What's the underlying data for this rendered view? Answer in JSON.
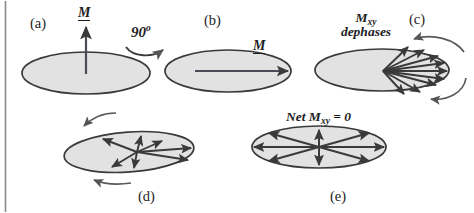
{
  "figure": {
    "title_semantic": "nmr-magnetization-dephasing-diagram",
    "background_color": "#ffffff",
    "border_color": "#8a8a8a",
    "ellipse_fill": "#e2e2e2",
    "ellipse_stroke": "#3a3a3a",
    "arrow_color": "#3a3a3a",
    "text_color": "#1d1d1d",
    "width": 474,
    "height": 213
  },
  "panels": {
    "a": {
      "letter": "(a)",
      "vector_label": "M",
      "description": "Longitudinal magnetization M along z, perpendicular to transverse plane"
    },
    "b": {
      "letter": "(b)",
      "vector_label": "M",
      "description": "Magnetization M tipped into transverse plane"
    },
    "c": {
      "letter": "(c)",
      "caption_line1": "M",
      "caption_sub": "xy",
      "caption_line2": "dephases",
      "description": "Transverse magnetization begins to dephase into a fan of spin isochromats"
    },
    "d": {
      "letter": "(d)",
      "description": "Spin isochromats spread further apart around the transverse plane"
    },
    "e": {
      "letter": "(e)",
      "caption": "Net M",
      "caption_sub": "xy",
      "caption_tail": " = 0",
      "description": "Isochromats uniformly distributed so the net transverse magnetization is zero"
    }
  },
  "annotations": {
    "rotation": {
      "value": "90",
      "unit": "o",
      "full": "90 o",
      "description": "90 degree RF excitation pulse flips M into transverse plane"
    }
  },
  "icons": {
    "vector_arrow": "arrow-icon",
    "curved_arrow": "curved-arrow-icon",
    "ellipse": "ellipse-plane-icon"
  }
}
